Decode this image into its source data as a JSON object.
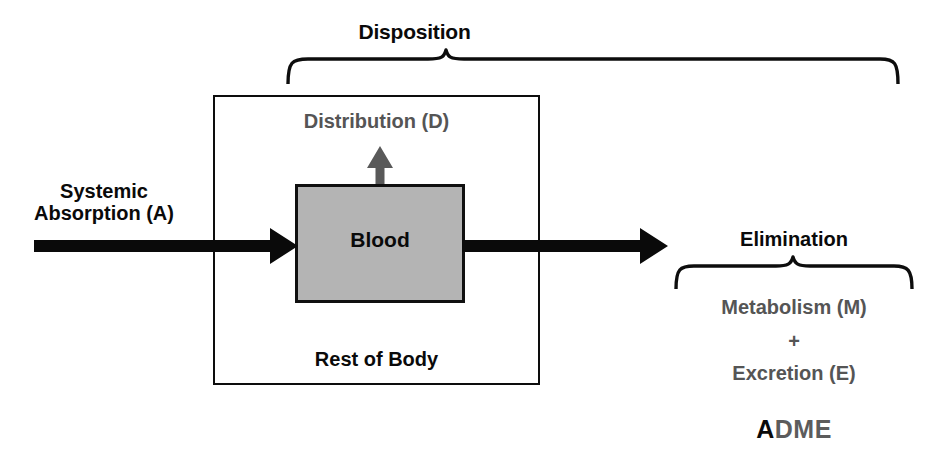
{
  "diagram": {
    "groups": {
      "disposition": {
        "label": "Disposition",
        "brace_span_px": [
          290,
          895
        ]
      },
      "elimination": {
        "label": "Elimination",
        "brace_span_px": [
          678,
          910
        ]
      }
    },
    "boxes": {
      "body": {
        "label": "Rest of Body",
        "fill": "#ffffff",
        "stroke": "#0d0d0d"
      },
      "blood": {
        "label": "Blood",
        "fill": "#b4b4b4",
        "stroke": "#101010"
      }
    },
    "processes": {
      "absorption": {
        "label": "Systemic\nAbsorption (A)",
        "line1": "Systemic",
        "line2": "Absorption (A)",
        "color": "#0a0a0a"
      },
      "distribution": {
        "label": "Distribution (D)",
        "color": "#555555"
      },
      "metabolism": {
        "label": "Metabolism (M)",
        "color": "#555555"
      },
      "plus": {
        "label": "+",
        "color": "#555555"
      },
      "excretion": {
        "label": "Excretion (E)",
        "color": "#555555"
      }
    },
    "acronym": {
      "first_letter": "A",
      "rest": "DME",
      "first_color": "#0a0a0a",
      "rest_color": "#5c5c5c"
    },
    "colors": {
      "black": "#0a0a0a",
      "gray_text": "#555555",
      "blood_fill": "#b4b4b4",
      "distribution_arrow": "#595959",
      "background": "#ffffff"
    }
  }
}
